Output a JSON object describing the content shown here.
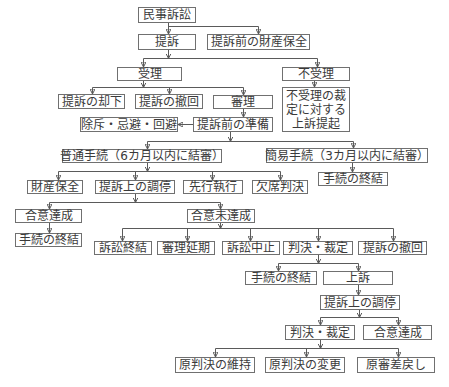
{
  "diagram": {
    "title": "民事訴訟",
    "nodes": [
      {
        "id": "n0",
        "label": "民事訴訟"
      },
      {
        "id": "n1",
        "label": "提訴"
      },
      {
        "id": "n2",
        "label": "提訴前の財産保全"
      },
      {
        "id": "n3",
        "label": "受理"
      },
      {
        "id": "n4",
        "label": "不受理"
      },
      {
        "id": "n5",
        "label": "提訴の却下"
      },
      {
        "id": "n6",
        "label": "提訴の撤回"
      },
      {
        "id": "n7",
        "label": "審理"
      },
      {
        "id": "n8",
        "label": "不受理の裁定に対する上訴提起",
        "lines": [
          "不受理の裁",
          "定に対する",
          "上訴提起"
        ]
      },
      {
        "id": "n9",
        "label": "除斥・忌避・回避"
      },
      {
        "id": "n10",
        "label": "提訴前の準備"
      },
      {
        "id": "n11",
        "label": "普通手続（6カ月以内に結審）"
      },
      {
        "id": "n12",
        "label": "簡易手続（3カ月以内に結審）"
      },
      {
        "id": "n13",
        "label": "財産保全"
      },
      {
        "id": "n14",
        "label": "提訴上の調停"
      },
      {
        "id": "n15",
        "label": "先行執行"
      },
      {
        "id": "n16",
        "label": "欠席判決"
      },
      {
        "id": "n17",
        "label": "手続の終結"
      },
      {
        "id": "n18",
        "label": "合意達成"
      },
      {
        "id": "n19",
        "label": "合意未達成"
      },
      {
        "id": "n20",
        "label": "手続の終結"
      },
      {
        "id": "n21",
        "label": "訴訟終結"
      },
      {
        "id": "n22",
        "label": "審理延期"
      },
      {
        "id": "n23",
        "label": "訴訟中止"
      },
      {
        "id": "n24",
        "label": "判決・裁定"
      },
      {
        "id": "n25",
        "label": "提訴の撤回"
      },
      {
        "id": "n26",
        "label": "手続の終結"
      },
      {
        "id": "n27",
        "label": "上訴"
      },
      {
        "id": "n28",
        "label": "提訴上の調停"
      },
      {
        "id": "n29",
        "label": "判決・裁定"
      },
      {
        "id": "n30",
        "label": "合意達成"
      },
      {
        "id": "n31",
        "label": "原判決の維持"
      },
      {
        "id": "n32",
        "label": "原判決の変更"
      },
      {
        "id": "n33",
        "label": "原審差戻し"
      }
    ],
    "edges": [
      [
        "n0",
        "n1"
      ],
      [
        "n0",
        "n2"
      ],
      [
        "n1",
        "n3"
      ],
      [
        "n1",
        "n4"
      ],
      [
        "n3",
        "n5"
      ],
      [
        "n3",
        "n6"
      ],
      [
        "n3",
        "n7"
      ],
      [
        "n4",
        "n8"
      ],
      [
        "n7",
        "n10"
      ],
      [
        "n10",
        "n9"
      ],
      [
        "n10",
        "n11"
      ],
      [
        "n10",
        "n12"
      ],
      [
        "n11",
        "n13"
      ],
      [
        "n11",
        "n14"
      ],
      [
        "n11",
        "n15"
      ],
      [
        "n11",
        "n16"
      ],
      [
        "n12",
        "n17"
      ],
      [
        "n14",
        "n18"
      ],
      [
        "n14",
        "n19"
      ],
      [
        "n18",
        "n20"
      ],
      [
        "n19",
        "n21"
      ],
      [
        "n19",
        "n22"
      ],
      [
        "n19",
        "n23"
      ],
      [
        "n19",
        "n24"
      ],
      [
        "n19",
        "n25"
      ],
      [
        "n24",
        "n26"
      ],
      [
        "n24",
        "n27"
      ],
      [
        "n27",
        "n28"
      ],
      [
        "n28",
        "n29"
      ],
      [
        "n28",
        "n30"
      ],
      [
        "n29",
        "n31"
      ],
      [
        "n29",
        "n32"
      ],
      [
        "n29",
        "n33"
      ]
    ],
    "colors": {
      "line": "#5a5a5a",
      "border": "#707070",
      "text": "#3a3a3a",
      "background": "#ffffff"
    }
  }
}
